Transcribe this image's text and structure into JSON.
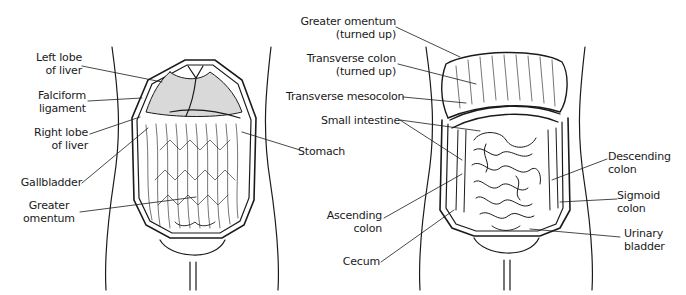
{
  "figure": {
    "panels": [
      {
        "id": "left",
        "description": "Abdomen opened showing greater omentum covering intestines",
        "labels": [
          {
            "key": "left_lobe_liver",
            "lines": [
              "Left lobe",
              "of liver"
            ]
          },
          {
            "key": "falciform",
            "lines": [
              "Falciform",
              "ligament"
            ]
          },
          {
            "key": "right_lobe_liver",
            "lines": [
              "Right lobe",
              "of liver"
            ]
          },
          {
            "key": "gallbladder",
            "lines": [
              "Gallbladder"
            ]
          },
          {
            "key": "greater_omentum",
            "lines": [
              "Greater",
              "omentum"
            ]
          },
          {
            "key": "stomach",
            "lines": [
              "Stomach"
            ]
          }
        ]
      },
      {
        "id": "right",
        "description": "Abdomen with greater omentum and transverse colon turned up exposing small intestine",
        "labels": [
          {
            "key": "greater_omentum_up",
            "lines": [
              "Greater omentum",
              "(turned up)"
            ]
          },
          {
            "key": "transverse_colon_up",
            "lines": [
              "Transverse colon",
              "(turned up)"
            ]
          },
          {
            "key": "transverse_mesocolon",
            "lines": [
              "Transverse mesocolon"
            ]
          },
          {
            "key": "small_intestine",
            "lines": [
              "Small intestine"
            ]
          },
          {
            "key": "ascending_colon",
            "lines": [
              "Ascending",
              "colon"
            ]
          },
          {
            "key": "cecum",
            "lines": [
              "Cecum"
            ]
          },
          {
            "key": "descending_colon",
            "lines": [
              "Descending",
              "colon"
            ]
          },
          {
            "key": "sigmoid_colon",
            "lines": [
              "Sigmoid",
              "colon"
            ]
          },
          {
            "key": "urinary_bladder",
            "lines": [
              "Urinary",
              "bladder"
            ]
          }
        ]
      }
    ],
    "colors": {
      "ink": "#1a1a1a",
      "background": "#ffffff"
    }
  }
}
